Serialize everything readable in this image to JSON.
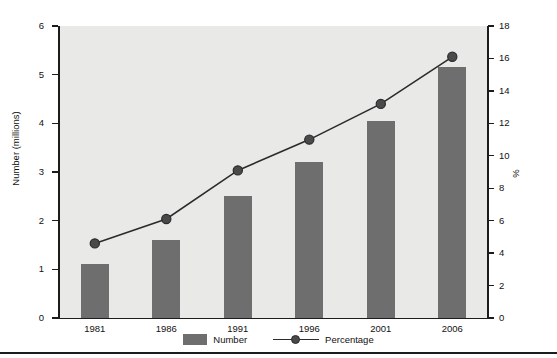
{
  "chart_data": {
    "type": "bar",
    "title": "",
    "subtitle": "",
    "xlabel": "",
    "ylabel": "Number (millions)",
    "y2label": "%",
    "categories": [
      "1981",
      "1986",
      "1991",
      "1996",
      "2001",
      "2006"
    ],
    "grid": false,
    "legend_position": "bottom",
    "ylim": [
      0,
      6
    ],
    "yticks": [
      0,
      1,
      2,
      3,
      4,
      5,
      6
    ],
    "y2lim": [
      0,
      18
    ],
    "y2ticks": [
      0,
      2,
      4,
      6,
      8,
      10,
      12,
      14,
      16,
      18
    ],
    "series": [
      {
        "name": "Number",
        "type": "bar",
        "axis": "left",
        "units": "millions",
        "color": "#6e6e6e",
        "values": [
          1.1,
          1.6,
          2.5,
          3.2,
          4.05,
          5.15
        ]
      },
      {
        "name": "Percentage",
        "type": "line",
        "axis": "right",
        "units": "%",
        "color": "#2b2b2b",
        "marker": "circle",
        "values": [
          4.6,
          6.1,
          9.1,
          11.0,
          13.2,
          16.1
        ]
      }
    ]
  },
  "legend": {
    "items": [
      {
        "label": "Number",
        "marker": "bar-swatch"
      },
      {
        "label": "Percentage",
        "marker": "line-with-circle"
      }
    ]
  },
  "colors": {
    "bar": "#6e6e6e",
    "line": "#2b2b2b",
    "plot_background": "#e9e9e7",
    "axis": "#1c1c1c",
    "page_background": "#ffffff"
  }
}
